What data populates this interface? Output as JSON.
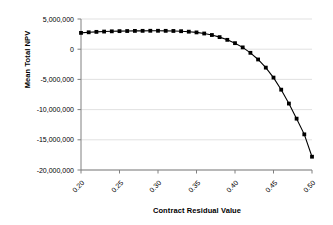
{
  "chart_data": {
    "type": "line",
    "title": "",
    "xlabel": "Contract Residual Value",
    "ylabel": "Mean Total NPV",
    "xlim": [
      0.2,
      0.5
    ],
    "ylim": [
      -20000000,
      5000000
    ],
    "xticks": [
      0.2,
      0.25,
      0.3,
      0.35,
      0.4,
      0.45,
      0.5
    ],
    "xtick_labels": [
      "0.20",
      "0.25",
      "0.30",
      "0.35",
      "0.40",
      "0.45",
      "0.50"
    ],
    "yticks": [
      5000000,
      0,
      -5000000,
      -10000000,
      -15000000,
      -20000000
    ],
    "ytick_labels": [
      "5,000,000",
      "0",
      "-5,000,000",
      "-10,000,000",
      "-15,000,000",
      "-20,000,000"
    ],
    "grid": "horizontal",
    "legend": "none",
    "marker": "square",
    "marker_color": "#000000",
    "line_color": "#000000",
    "series": [
      {
        "name": "Mean Total NPV",
        "x": [
          0.2,
          0.21,
          0.22,
          0.23,
          0.24,
          0.25,
          0.26,
          0.27,
          0.28,
          0.29,
          0.3,
          0.31,
          0.32,
          0.33,
          0.34,
          0.35,
          0.36,
          0.37,
          0.38,
          0.39,
          0.4,
          0.41,
          0.42,
          0.43,
          0.44,
          0.45,
          0.46,
          0.47,
          0.48,
          0.49,
          0.5
        ],
        "values": [
          2700000,
          2800000,
          2870000,
          2920000,
          2960000,
          2990000,
          3010000,
          3030000,
          3040000,
          3050000,
          3050000,
          3040000,
          3020000,
          2980000,
          2900000,
          2780000,
          2600000,
          2350000,
          2000000,
          1550000,
          1000000,
          300000,
          -600000,
          -1700000,
          -3050000,
          -4700000,
          -6700000,
          -9000000,
          -11500000,
          -14100000,
          -17800000
        ]
      }
    ]
  },
  "axes": {
    "y_title": "Mean Total NPV",
    "x_title": "Contract Residual Value"
  },
  "colors": {
    "gridline": "#d9d9d9",
    "axis": "#808080",
    "series": "#000000",
    "background": "#ffffff"
  }
}
